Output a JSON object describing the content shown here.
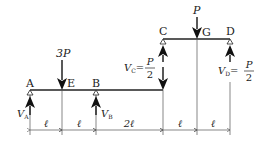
{
  "diagram": {
    "type": "structural beam free-body diagram (Gerber beam)",
    "nodes": {
      "A": {
        "label": "A",
        "support": "pin"
      },
      "E": {
        "label": "E"
      },
      "B": {
        "label": "B",
        "support": "roller"
      },
      "C": {
        "label": "C",
        "support": "hinge"
      },
      "G": {
        "label": "G"
      },
      "D": {
        "label": "D",
        "support": "roller"
      }
    },
    "loads": {
      "at_E": "3P",
      "at_G": "P",
      "at_C_down_on_lower": "V_C = P/2"
    },
    "reactions": {
      "VA": {
        "sym": "V",
        "sub": "A"
      },
      "VB": {
        "sym": "V",
        "sub": "B"
      },
      "VC": {
        "sym": "V",
        "sub": "C",
        "eq": "=",
        "num": "P",
        "den": "2"
      },
      "VD": {
        "sym": "V",
        "sub": "D",
        "eq": "=",
        "num": "P",
        "den": "2"
      }
    },
    "dimensions": [
      "ℓ",
      "ℓ",
      "2ℓ",
      "ℓ",
      "ℓ"
    ],
    "colors": {
      "line": "#222222",
      "thin": "#555555",
      "background": "#ffffff"
    }
  }
}
